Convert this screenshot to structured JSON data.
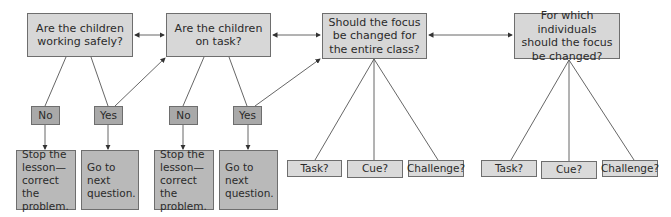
{
  "diagram": {
    "type": "decision-flowchart",
    "questions": [
      {
        "id": "q1",
        "label": "Are the children\nworking safely?"
      },
      {
        "id": "q2",
        "label": "Are the children\non task?"
      },
      {
        "id": "q3",
        "label": "Should the focus\nbe changed for\nthe entire class?"
      },
      {
        "id": "q4",
        "label": "For which individuals\nshould the focus\nbe changed?"
      }
    ],
    "answers": [
      {
        "id": "q1-no",
        "label": "No"
      },
      {
        "id": "q1-yes",
        "label": "Yes"
      },
      {
        "id": "q2-no",
        "label": "No"
      },
      {
        "id": "q2-yes",
        "label": "Yes"
      }
    ],
    "actions": [
      {
        "id": "q1-stop",
        "label": "Stop the\nlesson—\ncorrect the\nproblem."
      },
      {
        "id": "q1-next",
        "label": "Go to next\nquestion."
      },
      {
        "id": "q2-stop",
        "label": "Stop the\nlesson—\ncorrect the\nproblem."
      },
      {
        "id": "q2-next",
        "label": "Go to next\nquestion."
      }
    ],
    "class_options": [
      {
        "label": "Task?"
      },
      {
        "label": "Cue?"
      },
      {
        "label": "Challenge?"
      }
    ],
    "individual_options": [
      {
        "label": "Task?"
      },
      {
        "label": "Cue?"
      },
      {
        "label": "Challenge?"
      }
    ],
    "colors": {
      "question_fill": "#d7d7d7",
      "answer_fill": "#a9a9a9",
      "action_fill": "#b9b9b9",
      "option_fill": "#dadada",
      "line": "#555555"
    }
  }
}
